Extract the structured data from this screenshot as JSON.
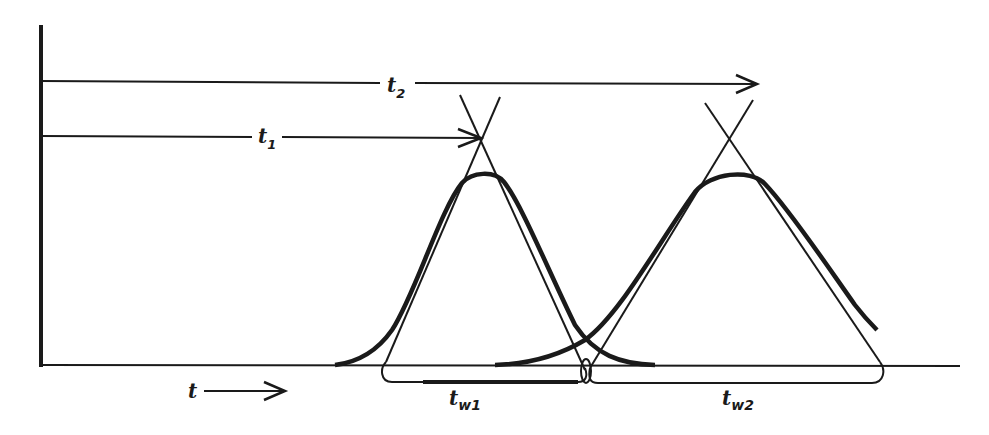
{
  "diagram": {
    "labels": {
      "t2": {
        "main": "t",
        "sub": "2"
      },
      "t1": {
        "main": "t",
        "sub": "1"
      },
      "tw1": {
        "main": "t",
        "sub": "w1"
      },
      "tw2": {
        "main": "t",
        "sub": "w2"
      },
      "time_axis": {
        "main": "t"
      }
    },
    "colors": {
      "ink": "#1a1a1a",
      "background": "#ffffff"
    },
    "elements": {
      "y_axis": "vertical axis",
      "baseline": "horizontal baseline",
      "peak_1": "gaussian peak 1 with tangent lines",
      "peak_2": "gaussian peak 2 with tangent lines",
      "t1_arrow": "retention time arrow to peak 1 apex",
      "t2_arrow": "retention time arrow to peak 2 apex",
      "tw1_bracket": "peak width bracket 1",
      "tw2_bracket": "peak width bracket 2",
      "time_arrow": "direction of time arrow"
    }
  }
}
